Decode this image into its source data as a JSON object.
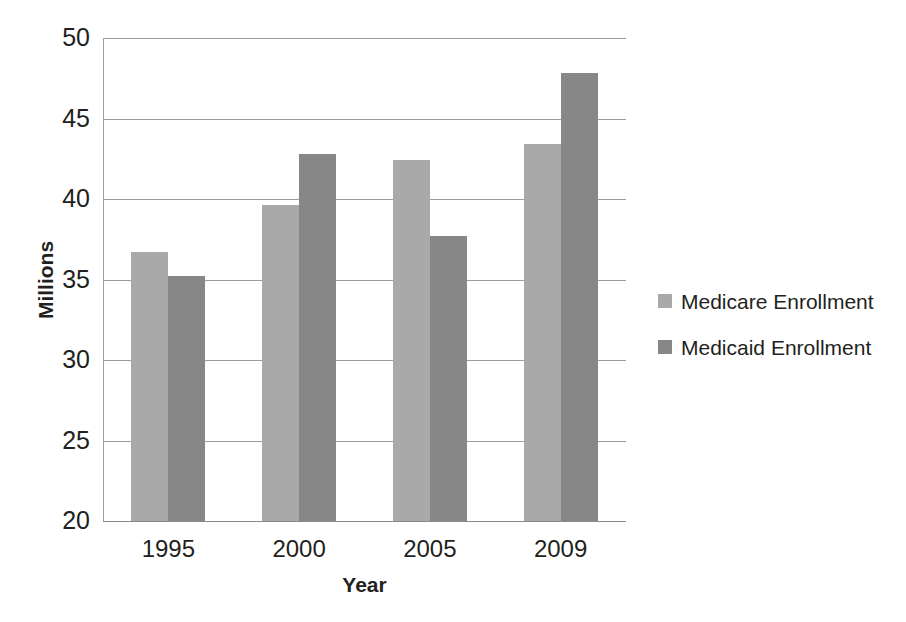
{
  "chart_data": {
    "type": "bar",
    "title": "",
    "subtitle": "",
    "xlabel": "Year",
    "ylabel": "Millions",
    "categories": [
      "1995",
      "2000",
      "2005",
      "2009"
    ],
    "series": [
      {
        "name": "Medicare Enrollment",
        "color": "#a9a9a9",
        "values": [
          36.7,
          39.6,
          42.4,
          43.4
        ]
      },
      {
        "name": "Medicaid Enrollment",
        "color": "#878787",
        "values": [
          35.2,
          42.8,
          37.7,
          47.8
        ]
      }
    ],
    "ylim": [
      20,
      50
    ],
    "yticks": [
      20,
      25,
      30,
      35,
      40,
      45,
      50
    ],
    "ytick_labels": [
      "20",
      "25",
      "30",
      "35",
      "40",
      "45",
      "50"
    ],
    "grid": true,
    "grid_axis": "y",
    "legend_position": "right",
    "legend": [
      "Medicare Enrollment",
      "Medicaid Enrollment"
    ],
    "annotations": []
  }
}
